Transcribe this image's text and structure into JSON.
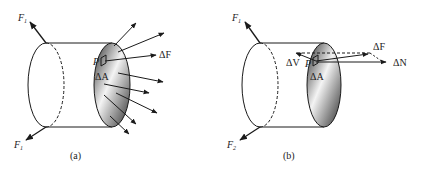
{
  "figure_a": {
    "caption": "(a)",
    "force_top": "F",
    "force_top_sub": "1",
    "force_bottom": "F",
    "force_bottom_sub": "1",
    "delta_F": "ΔF",
    "point": "P",
    "delta_A": "ΔA"
  },
  "figure_b": {
    "caption": "(b)",
    "force_top": "F",
    "force_top_sub": "1",
    "force_bottom": "F",
    "force_bottom_sub": "2",
    "delta_F": "ΔF",
    "delta_V": "ΔV",
    "delta_N": "ΔN",
    "point": "P",
    "delta_A": "ΔA"
  },
  "colors": {
    "stroke": "#1a1a1a",
    "shade_dark": "#3a3a3a",
    "shade_light": "#f2f2f2"
  }
}
